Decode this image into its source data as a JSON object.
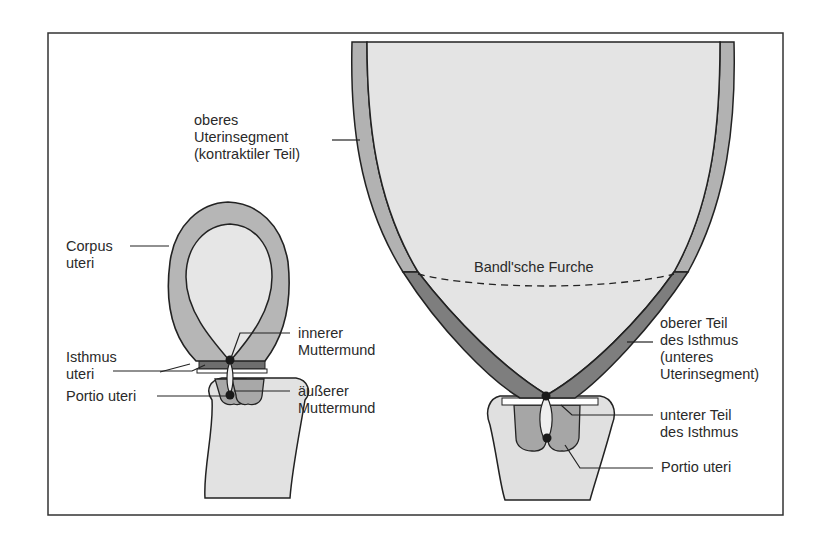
{
  "colors": {
    "frame": "#333333",
    "cavity_fill": "#e6e6e6",
    "wall_upper": "#b4b4b4",
    "wall_isthmus": "#8c8c8c",
    "cervix_outer": "#dedede",
    "portio_fill": "#aaaaaa",
    "outline": "#222222"
  },
  "left_figure": {
    "labels": {
      "corpus_uteri": [
        "Corpus",
        "uteri"
      ],
      "isthmus_uteri": [
        "Isthmus",
        "uteri"
      ],
      "portio_uteri": "Portio uteri",
      "innerer_muttermund": [
        "innerer",
        "Muttermund"
      ],
      "aeusserer_muttermund": [
        "äußerer",
        "Muttermund"
      ]
    }
  },
  "right_figure": {
    "labels": {
      "oberes_uterinsegment": [
        "oberes",
        "Uterinsegment",
        "(kontraktiler Teil)"
      ],
      "bandlsche_furche": "Bandl'sche Furche",
      "oberer_teil_isthmus": [
        "oberer Teil",
        "des Isthmus",
        "(unteres",
        "Uterinsegment)"
      ],
      "unterer_teil_isthmus": [
        "unterer Teil",
        "des Isthmus"
      ],
      "portio_uteri": "Portio uteri"
    }
  }
}
